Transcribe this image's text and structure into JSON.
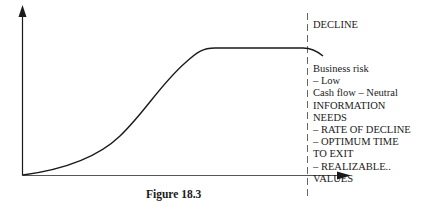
{
  "figure": {
    "caption": "Figure 18.3",
    "stage_label": "DECLINE",
    "notes": [
      "Business risk",
      "– Low",
      "Cash flow – Neutral",
      "INFORMATION",
      "NEEDS",
      "– RATE OF DECLINE",
      "– OPTIMUM TIME",
      "TO EXIT",
      "– REALIZABLE..",
      "VALUES"
    ],
    "axes": {
      "x_label": "",
      "y_label": "",
      "has_arrows": true
    },
    "curve": {
      "description": "S-shaped life-cycle curve: slow start, steep growth, flat plateau (maturity), slight downturn after the decline divider",
      "color": "#1a1a1a"
    },
    "divider": {
      "style": "dashed",
      "marks": "start of decline stage"
    }
  }
}
